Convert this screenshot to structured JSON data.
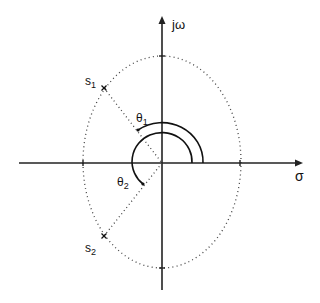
{
  "diagram": {
    "axes": {
      "vertical_label": "jω",
      "horizontal_label": "σ"
    },
    "poles": [
      {
        "label": "s",
        "subscript": "1",
        "marker": "x"
      },
      {
        "label": "s",
        "subscript": "2",
        "marker": "x"
      }
    ],
    "angles": [
      {
        "label": "θ",
        "subscript": "1"
      },
      {
        "label": "θ",
        "subscript": "2"
      }
    ],
    "colors": {
      "line": "#111111",
      "background": "#ffffff"
    }
  }
}
